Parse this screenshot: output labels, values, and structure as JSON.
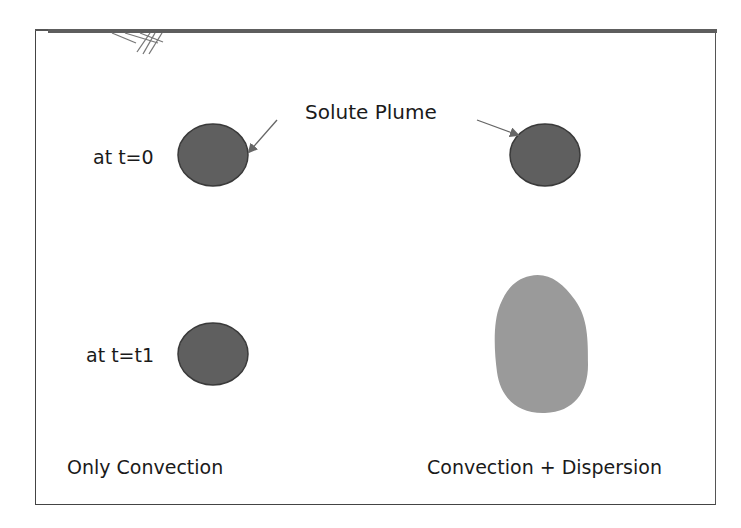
{
  "diagram": {
    "title_label": "Solute Plume",
    "rows": [
      {
        "label": "at t=0"
      },
      {
        "label": "at t=t1"
      }
    ],
    "columns": [
      {
        "caption": "Only Convection"
      },
      {
        "caption": "Convection + Dispersion"
      }
    ],
    "colors": {
      "plume_dark": "#5f5f5f",
      "plume_outline": "#3a3a3a",
      "plume_dispersed": "#9a9a9a",
      "arrow": "#666666",
      "frame": "#444444"
    }
  }
}
